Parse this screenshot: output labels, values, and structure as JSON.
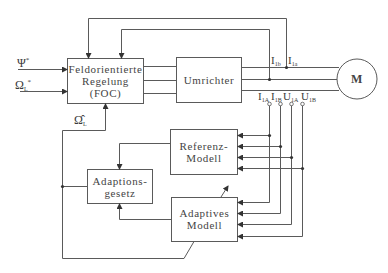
{
  "diagram": {
    "type": "block-diagram",
    "blocks": {
      "foc": {
        "line1": "Feldorientierte",
        "line2": "Regelung",
        "line3": "(FOC)"
      },
      "umrichter": {
        "label": "Umrichter"
      },
      "motor": {
        "label": "M"
      },
      "referenz": {
        "line1": "Referenz-",
        "line2": "Modell"
      },
      "adaptions": {
        "line1": "Adaptions-",
        "line2": "gesetz"
      },
      "adaptives": {
        "line1": "Adaptives",
        "line2": "Modell"
      }
    },
    "inputs": {
      "psi": {
        "symbol": "Ψ",
        "sup": "*"
      },
      "omega": {
        "symbol": "Ω",
        "sub": "L",
        "sup": "*"
      },
      "omega_hat": {
        "symbol": "Ω̂",
        "sub": "L"
      }
    },
    "signals": {
      "i1b": {
        "symbol": "I",
        "sub": "1b"
      },
      "i1a": {
        "symbol": "I",
        "sub": "1a"
      },
      "i1A": {
        "symbol": "I",
        "sub": "1A"
      },
      "i1B": {
        "symbol": "I",
        "sub": "1B"
      },
      "u1A": {
        "symbol": "U",
        "sub": "1A"
      },
      "u1B": {
        "symbol": "U",
        "sub": "1B"
      }
    },
    "colors": {
      "line": "#555555",
      "text": "#3a3a3a",
      "background": "#ffffff"
    }
  }
}
